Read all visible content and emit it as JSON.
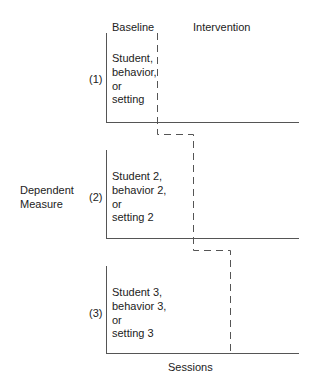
{
  "diagram": {
    "type": "multiple-baseline-design",
    "phases": {
      "baseline": "Baseline",
      "intervention": "Intervention"
    },
    "y_label": [
      "Dependent",
      "Measure"
    ],
    "x_label": "Sessions",
    "panels": [
      {
        "number": "(1)",
        "lines": [
          "Student,",
          "behavior,",
          "or",
          "setting"
        ]
      },
      {
        "number": "(2)",
        "lines": [
          "Student 2,",
          "behavior 2,",
          "or",
          "setting 2"
        ]
      },
      {
        "number": "(3)",
        "lines": [
          "Student 3,",
          "behavior 3,",
          "or",
          "setting 3"
        ]
      }
    ],
    "colors": {
      "axis": "#555555",
      "dashed": "#555555",
      "text": "#222222"
    }
  }
}
